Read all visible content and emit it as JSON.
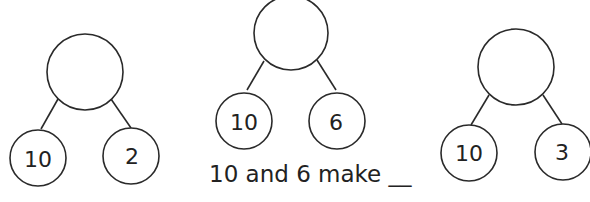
{
  "bonds": [
    {
      "whole": "",
      "part1": "10",
      "part2": "2"
    },
    {
      "whole": "",
      "part1": "10",
      "part2": "6",
      "caption": "10 and 6 make __"
    },
    {
      "whole": "",
      "part1": "10",
      "part2": "3"
    }
  ]
}
